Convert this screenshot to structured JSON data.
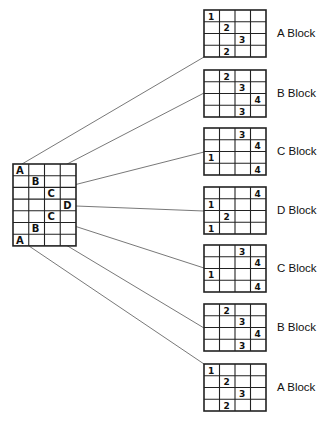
{
  "diagram": {
    "source_grid": {
      "x": 13,
      "y": 164,
      "cols": 4,
      "rows": 7,
      "cell_w": 15.75,
      "cell_h": 11.7,
      "cells": [
        {
          "row": 0,
          "col": 0,
          "text": "A"
        },
        {
          "row": 1,
          "col": 1,
          "text": "B"
        },
        {
          "row": 2,
          "col": 2,
          "text": "C"
        },
        {
          "row": 3,
          "col": 3,
          "text": "D"
        },
        {
          "row": 4,
          "col": 2,
          "text": "C"
        },
        {
          "row": 5,
          "col": 1,
          "text": "B"
        },
        {
          "row": 6,
          "col": 0,
          "text": "A"
        }
      ]
    },
    "blocks": [
      {
        "label": "A Block",
        "x": 204,
        "y": 10,
        "cells": [
          [
            0,
            0,
            "1"
          ],
          [
            1,
            1,
            "2"
          ],
          [
            2,
            2,
            "3"
          ],
          [
            3,
            1,
            "2"
          ]
        ]
      },
      {
        "label": "B Block",
        "x": 204,
        "y": 70,
        "cells": [
          [
            0,
            1,
            "2"
          ],
          [
            1,
            2,
            "3"
          ],
          [
            2,
            3,
            "4"
          ],
          [
            3,
            2,
            "3"
          ]
        ]
      },
      {
        "label": "C Block",
        "x": 204,
        "y": 128,
        "cells": [
          [
            0,
            2,
            "3"
          ],
          [
            1,
            3,
            "4"
          ],
          [
            2,
            0,
            "1"
          ],
          [
            3,
            3,
            "4"
          ]
        ]
      },
      {
        "label": "D Block",
        "x": 204,
        "y": 187,
        "cells": [
          [
            0,
            3,
            "4"
          ],
          [
            1,
            0,
            "1"
          ],
          [
            2,
            1,
            "2"
          ],
          [
            3,
            0,
            "1"
          ]
        ]
      },
      {
        "label": "C Block",
        "x": 204,
        "y": 245,
        "cells": [
          [
            0,
            2,
            "3"
          ],
          [
            1,
            3,
            "4"
          ],
          [
            2,
            0,
            "1"
          ],
          [
            3,
            3,
            "4"
          ]
        ]
      },
      {
        "label": "B Block",
        "x": 204,
        "y": 304,
        "cells": [
          [
            0,
            1,
            "2"
          ],
          [
            1,
            2,
            "3"
          ],
          [
            2,
            3,
            "4"
          ],
          [
            3,
            2,
            "3"
          ]
        ]
      },
      {
        "label": "A Block",
        "x": 204,
        "y": 364,
        "cells": [
          [
            0,
            0,
            "1"
          ],
          [
            1,
            1,
            "2"
          ],
          [
            2,
            2,
            "3"
          ],
          [
            3,
            1,
            "2"
          ]
        ]
      }
    ],
    "block_geometry": {
      "cols": 4,
      "rows": 4,
      "cell_w": 15.5,
      "cell_h": 11.75
    },
    "connectors": [
      {
        "from": [
          22,
          164
        ],
        "to": [
          204,
          57
        ]
      },
      {
        "from": [
          44,
          176
        ],
        "to": [
          204,
          93
        ]
      },
      {
        "from": [
          62,
          188
        ],
        "to": [
          204,
          152
        ]
      },
      {
        "from": [
          76,
          206
        ],
        "to": [
          204,
          211
        ]
      },
      {
        "from": [
          62,
          222
        ],
        "to": [
          204,
          268
        ]
      },
      {
        "from": [
          46,
          233
        ],
        "to": [
          204,
          328
        ]
      },
      {
        "from": [
          29,
          246
        ],
        "to": [
          204,
          364
        ]
      }
    ],
    "colors": {
      "line": "#222222",
      "connector": "#555555",
      "text": "#111111"
    }
  }
}
